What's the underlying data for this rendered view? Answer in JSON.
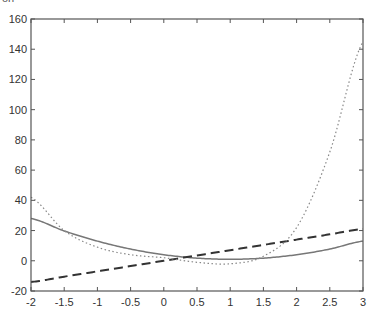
{
  "header": {
    "cropped_text": "on"
  },
  "chart_data": {
    "type": "line",
    "title": "",
    "xlabel": "",
    "ylabel": "",
    "xlim": [
      -2,
      3
    ],
    "ylim": [
      -20,
      160
    ],
    "grid": false,
    "legend": null,
    "x_ticks": [
      -2,
      -1.5,
      -1,
      -0.5,
      0,
      0.5,
      1,
      1.5,
      2,
      2.5,
      3
    ],
    "x_tick_labels": [
      "-2",
      "-1.5",
      "-1",
      "-0.5",
      "0",
      "0.5",
      "1",
      "1.5",
      "2",
      "2.5",
      "3"
    ],
    "y_ticks": [
      -20,
      0,
      20,
      40,
      60,
      80,
      100,
      120,
      140,
      160
    ],
    "y_tick_labels": [
      "-20",
      "0",
      "20",
      "40",
      "60",
      "80",
      "100",
      "120",
      "140",
      "160"
    ],
    "x": [
      -2,
      -1.5,
      -1,
      -0.5,
      0,
      0.5,
      1,
      1.5,
      2,
      2.5,
      3
    ],
    "series": [
      {
        "name": "solid curve",
        "style": "solid",
        "color": "#777777",
        "values": [
          28,
          19.75,
          13,
          7.75,
          4,
          1.75,
          1,
          1.75,
          4,
          7.75,
          13
        ]
      },
      {
        "name": "dashed line",
        "style": "dashed",
        "color": "#333333",
        "values": [
          -14,
          -10.5,
          -7,
          -3.5,
          0,
          3.5,
          7,
          10.5,
          14,
          17.5,
          21
        ]
      },
      {
        "name": "dotted curve",
        "style": "dotted",
        "color": "#888888",
        "values": [
          42,
          20,
          9,
          4,
          2,
          -1,
          -2,
          3,
          22,
          72,
          145
        ]
      }
    ]
  },
  "colors": {
    "axis": "#555555",
    "tick_text": "#333333",
    "background": "#ffffff"
  }
}
